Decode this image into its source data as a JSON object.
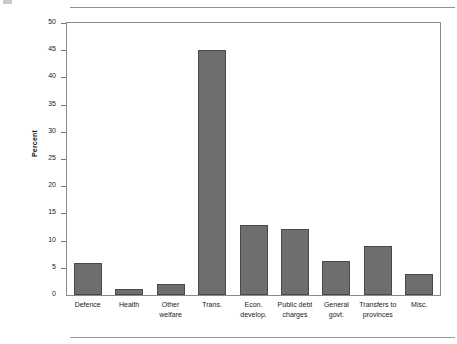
{
  "figure": {
    "rules": {
      "top": "horizontal-rule",
      "bottom": "horizontal-rule"
    }
  },
  "chart_data": {
    "type": "bar",
    "title": "",
    "subtitle": "",
    "xlabel": "",
    "ylabel": "Percent",
    "ylim": [
      0,
      50
    ],
    "ytick_step": 5,
    "yticks": [
      0,
      5,
      10,
      15,
      20,
      25,
      30,
      35,
      40,
      45,
      50
    ],
    "ytick_labels": [
      "0",
      "5",
      "10",
      "15",
      "20",
      "25",
      "30",
      "35",
      "40",
      "45",
      "50"
    ],
    "grid": false,
    "legend": null,
    "bar_color": "#6e6e6e",
    "bar_edge_color": "#4a4a4a",
    "axis_color": "#8a8a8a",
    "categories": [
      "Defence",
      "Health",
      "Other welfare",
      "Trans.",
      "Econ. develop.",
      "Public debt charges",
      "General govt.",
      "Transfers to provinces",
      "Misc."
    ],
    "category_lines": [
      [
        "Defence"
      ],
      [
        "Health"
      ],
      [
        "Other",
        "welfare"
      ],
      [
        "Trans."
      ],
      [
        "Econ.",
        "develop."
      ],
      [
        "Public debt",
        "charges"
      ],
      [
        "General",
        "govt."
      ],
      [
        "Transfers to",
        "provinces"
      ],
      [
        "Misc."
      ]
    ],
    "values": [
      5.8,
      1.1,
      2.0,
      45.0,
      12.8,
      12.2,
      6.3,
      9.0,
      3.8
    ]
  }
}
